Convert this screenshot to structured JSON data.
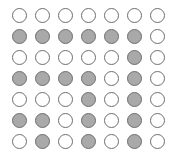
{
  "chart_data": {
    "type": "heatmap",
    "title": "",
    "subtitle": "",
    "xlabel": "",
    "ylabel": "",
    "legend": [],
    "annotations": [],
    "grid": false,
    "rows": 7,
    "columns": 7,
    "states": [
      "empty",
      "filled"
    ],
    "state_colors": {
      "empty": "#ffffff",
      "filled": "#a9a9a9",
      "outline": "#6e6e6e"
    },
    "background_color": "#ffffff",
    "marker_shape": "circle",
    "categories": [
      "C1",
      "C2",
      "C3",
      "C4",
      "C5",
      "C6",
      "C7"
    ],
    "row_labels": [
      "R1",
      "R2",
      "R3",
      "R4",
      "R5",
      "R6",
      "R7"
    ],
    "cells": [
      [
        "empty",
        "empty",
        "empty",
        "empty",
        "empty",
        "empty",
        "empty"
      ],
      [
        "filled",
        "filled",
        "filled",
        "filled",
        "filled",
        "filled",
        "empty"
      ],
      [
        "empty",
        "empty",
        "empty",
        "empty",
        "empty",
        "filled",
        "empty"
      ],
      [
        "filled",
        "filled",
        "filled",
        "filled",
        "empty",
        "filled",
        "empty"
      ],
      [
        "empty",
        "empty",
        "empty",
        "filled",
        "empty",
        "filled",
        "empty"
      ],
      [
        "filled",
        "filled",
        "empty",
        "filled",
        "empty",
        "filled",
        "empty"
      ],
      [
        "empty",
        "filled",
        "empty",
        "filled",
        "empty",
        "filled",
        "empty"
      ]
    ],
    "values": [
      [
        0,
        0,
        0,
        0,
        0,
        0,
        0
      ],
      [
        1,
        1,
        1,
        1,
        1,
        1,
        0
      ],
      [
        0,
        0,
        0,
        0,
        0,
        1,
        0
      ],
      [
        1,
        1,
        1,
        1,
        0,
        1,
        0
      ],
      [
        0,
        0,
        0,
        1,
        0,
        1,
        0
      ],
      [
        1,
        1,
        0,
        1,
        0,
        1,
        0
      ],
      [
        0,
        1,
        0,
        1,
        0,
        1,
        0
      ]
    ],
    "filled_count": 19,
    "empty_count": 30,
    "total_count": 49
  }
}
